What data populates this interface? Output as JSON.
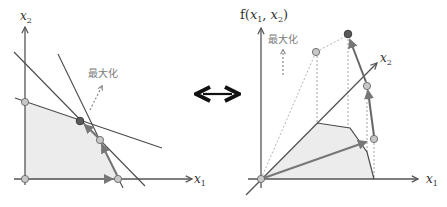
{
  "left_diagram": {
    "title": "Feasible region in decision space",
    "x_axis_label": "x",
    "x_axis_subscript": "1",
    "y_axis_label": "x",
    "y_axis_subscript": "2",
    "maximize_label": "最大化",
    "vertices": [
      {
        "name": "origin",
        "x": 25,
        "y": 179,
        "optimal": false
      },
      {
        "name": "x2-intercept",
        "x": 25,
        "y": 102,
        "optimal": false
      },
      {
        "name": "optimum",
        "x": 80,
        "y": 121,
        "optimal": true
      },
      {
        "name": "vertex-3",
        "x": 100,
        "y": 140,
        "optimal": false
      },
      {
        "name": "x1-intercept",
        "x": 118,
        "y": 179,
        "optimal": false
      }
    ],
    "path": [
      "origin",
      "x1-intercept",
      "vertex-3",
      "optimum"
    ]
  },
  "connector": {
    "symbol": "⟷",
    "icon": "double-arrow-icon"
  },
  "right_diagram": {
    "title": "Objective function surface",
    "z_axis_label": "f(x",
    "z_axis_label_full": [
      "f(",
      "x",
      "1",
      ", ",
      "x",
      "2",
      ")"
    ],
    "x_axis_label": "x",
    "x_axis_subscript": "1",
    "depth_axis_label": "x",
    "depth_axis_subscript": "2",
    "maximize_label": "最大化"
  },
  "colors": {
    "axis": "#555555",
    "constraint_line": "#4a4a4a",
    "region_fill": "#ececec",
    "vertex_fill": "#c8c8c8",
    "optimal_fill": "#5a5a5a",
    "path_arrow": "#777777",
    "dotted": "#999999",
    "label_gray": "#7a7a7a"
  }
}
